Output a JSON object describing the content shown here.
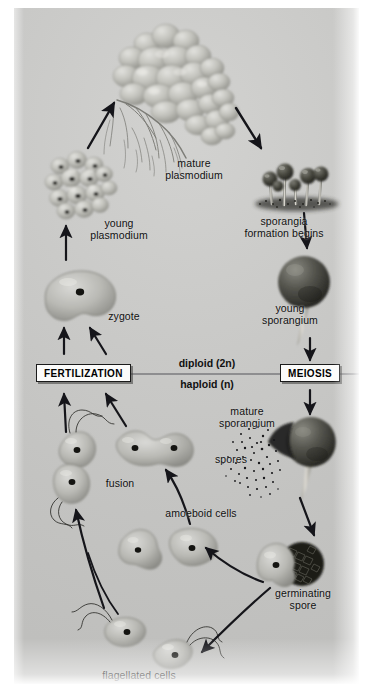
{
  "figure": {
    "background_color": "#c6c6c4",
    "paper_color": "#ffffff",
    "ink_color": "#111111"
  },
  "divider": {
    "diploid_label": "diploid (2n)",
    "haploid_label": "haploid (n)",
    "line_color": "#55555a"
  },
  "stage_boxes": [
    {
      "id": "fertilization",
      "label": "FERTILIZATION"
    },
    {
      "id": "meiosis",
      "label": "MEIOSIS"
    }
  ],
  "labels": [
    {
      "id": "mature-plasmodium",
      "text": "mature\nplasmodium"
    },
    {
      "id": "young-plasmodium",
      "text": "young\nplasmodium"
    },
    {
      "id": "sporangia-formation",
      "text": "sporangia\nformation begins"
    },
    {
      "id": "young-sporangium",
      "text": "young\nsporangium"
    },
    {
      "id": "mature-sporangium",
      "text": "mature\nsporangium"
    },
    {
      "id": "spores",
      "text": "spores"
    },
    {
      "id": "germinating-spore",
      "text": "germinating\nspore"
    },
    {
      "id": "flagellated-cells",
      "text": "flagellated cells"
    },
    {
      "id": "amoeboid-cells",
      "text": "amoeboid cells"
    },
    {
      "id": "fusion",
      "text": "fusion"
    },
    {
      "id": "zygote",
      "text": "zygote"
    }
  ]
}
